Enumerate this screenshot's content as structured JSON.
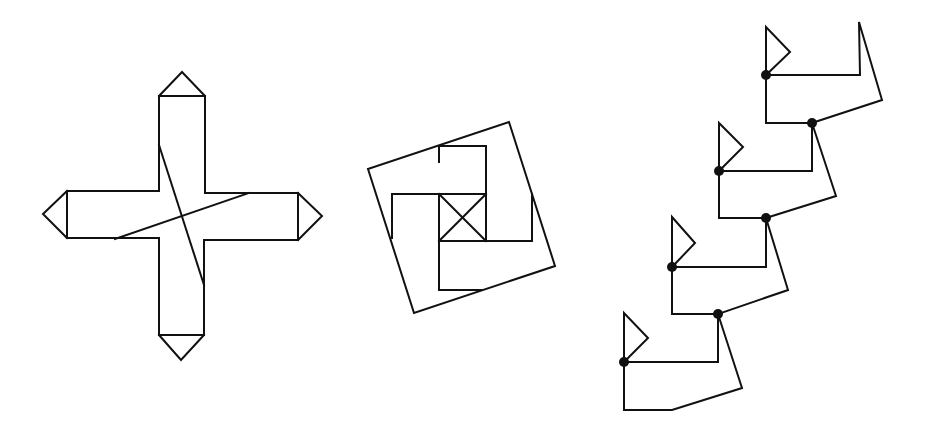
{
  "figures": [
    {
      "id": "cross",
      "name": "cross-with-arrow-tips",
      "polylines": [
        [
          [
            159,
            96
          ],
          [
            159,
            191
          ],
          [
            67,
            191
          ],
          [
            67,
            238
          ],
          [
            159,
            238
          ],
          [
            159,
            335
          ],
          [
            204,
            335
          ],
          [
            204,
            240
          ],
          [
            298,
            240
          ],
          [
            298,
            193
          ],
          [
            205,
            193
          ],
          [
            205,
            96
          ],
          [
            159,
            96
          ]
        ],
        [
          [
            159,
            96
          ],
          [
            182,
            72
          ],
          [
            205,
            96
          ]
        ],
        [
          [
            67,
            191
          ],
          [
            43,
            214
          ],
          [
            67,
            238
          ]
        ],
        [
          [
            298,
            193
          ],
          [
            322,
            216
          ],
          [
            298,
            240
          ]
        ],
        [
          [
            159,
            335
          ],
          [
            181,
            360
          ],
          [
            204,
            335
          ]
        ],
        [
          [
            159,
            145
          ],
          [
            204,
            285
          ]
        ],
        [
          [
            115,
            239
          ],
          [
            249,
            193
          ]
        ]
      ],
      "dots": []
    },
    {
      "id": "pinwheel-square",
      "name": "rotated-square-with-inner-pinwheel",
      "polylines": [
        [
          [
            368,
            169
          ],
          [
            509,
            122
          ],
          [
            555,
            266
          ],
          [
            414,
            313
          ],
          [
            368,
            169
          ]
        ],
        [
          [
            439,
            194
          ],
          [
            486,
            194
          ],
          [
            486,
            241
          ],
          [
            439,
            241
          ],
          [
            439,
            194
          ]
        ],
        [
          [
            439,
            194
          ],
          [
            486,
            241
          ]
        ],
        [
          [
            486,
            194
          ],
          [
            439,
            241
          ]
        ],
        [
          [
            439,
            162
          ],
          [
            439,
            146
          ],
          [
            486,
            146
          ],
          [
            486,
            194
          ]
        ],
        [
          [
            486,
            241
          ],
          [
            532,
            241
          ],
          [
            532,
            194
          ]
        ],
        [
          [
            439,
            241
          ],
          [
            439,
            290
          ],
          [
            482,
            290
          ]
        ],
        [
          [
            392,
            238
          ],
          [
            392,
            194
          ],
          [
            439,
            194
          ]
        ]
      ],
      "dots": []
    },
    {
      "id": "staircase",
      "name": "staircase-of-flagged-units",
      "polylines": [
        [
          [
            766,
            75
          ],
          [
            766,
            27
          ],
          [
            790,
            52
          ],
          [
            766,
            75
          ]
        ],
        [
          [
            766,
            75
          ],
          [
            860,
            75
          ],
          [
            859,
            22
          ],
          [
            882,
            100
          ],
          [
            812,
            123
          ]
        ],
        [
          [
            766,
            75
          ],
          [
            766,
            123
          ],
          [
            812,
            123
          ]
        ],
        [
          [
            719,
            171
          ],
          [
            719,
            123
          ],
          [
            743,
            147
          ],
          [
            719,
            171
          ]
        ],
        [
          [
            719,
            171
          ],
          [
            812,
            171
          ],
          [
            812,
            123
          ]
        ],
        [
          [
            812,
            123
          ],
          [
            836,
            196
          ],
          [
            766,
            218
          ]
        ],
        [
          [
            719,
            171
          ],
          [
            719,
            218
          ],
          [
            766,
            218
          ]
        ],
        [
          [
            672,
            267
          ],
          [
            672,
            217
          ],
          [
            695,
            243
          ],
          [
            672,
            267
          ]
        ],
        [
          [
            672,
            267
          ],
          [
            766,
            267
          ],
          [
            766,
            218
          ]
        ],
        [
          [
            766,
            218
          ],
          [
            788,
            290
          ],
          [
            718,
            314
          ]
        ],
        [
          [
            672,
            267
          ],
          [
            672,
            314
          ],
          [
            718,
            314
          ]
        ],
        [
          [
            624,
            362
          ],
          [
            624,
            313
          ],
          [
            648,
            338
          ],
          [
            624,
            362
          ]
        ],
        [
          [
            624,
            362
          ],
          [
            718,
            362
          ],
          [
            718,
            314
          ]
        ],
        [
          [
            718,
            314
          ],
          [
            742,
            388
          ],
          [
            672,
            410
          ],
          [
            624,
            410
          ],
          [
            624,
            362
          ]
        ]
      ],
      "dots": [
        [
          766,
          75
        ],
        [
          812,
          123
        ],
        [
          719,
          171
        ],
        [
          766,
          218
        ],
        [
          672,
          267
        ],
        [
          718,
          314
        ],
        [
          624,
          362
        ]
      ]
    }
  ],
  "style": {
    "stroke_color": "#111111",
    "background": "#ffffff"
  }
}
